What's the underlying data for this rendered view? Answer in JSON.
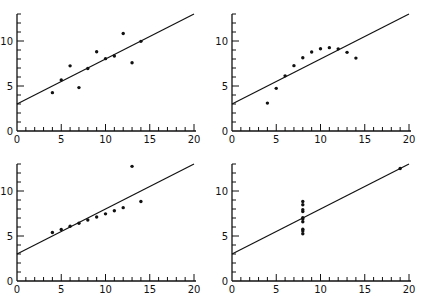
{
  "figure": {
    "title": ""
  },
  "axes_common": {
    "x_ticks": [
      "0",
      "5",
      "10",
      "15",
      "20"
    ],
    "y_ticks": [
      "0",
      "5",
      "10"
    ],
    "xlim": [
      0,
      20
    ],
    "ylim": [
      0,
      13
    ],
    "fit_line": {
      "intercept": 3.0,
      "slope": 0.5
    }
  },
  "chart_data": [
    {
      "type": "scatter",
      "title": "",
      "xlabel": "",
      "ylabel": "",
      "xlim": [
        0,
        20
      ],
      "ylim": [
        0,
        13
      ],
      "x_ticks": [
        0,
        5,
        10,
        15,
        20
      ],
      "y_ticks": [
        0,
        5,
        10
      ],
      "grid": false,
      "series": [
        {
          "name": "I",
          "x": [
            10,
            8,
            13,
            9,
            11,
            14,
            6,
            4,
            12,
            7,
            5
          ],
          "y": [
            8.04,
            6.95,
            7.58,
            8.81,
            8.33,
            9.96,
            7.24,
            4.26,
            10.84,
            4.82,
            5.68
          ]
        }
      ],
      "fit_line": {
        "intercept": 3.0,
        "slope": 0.5
      }
    },
    {
      "type": "scatter",
      "title": "",
      "xlabel": "",
      "ylabel": "",
      "xlim": [
        0,
        20
      ],
      "ylim": [
        0,
        13
      ],
      "x_ticks": [
        0,
        5,
        10,
        15,
        20
      ],
      "y_ticks": [
        0,
        5,
        10
      ],
      "grid": false,
      "series": [
        {
          "name": "II",
          "x": [
            10,
            8,
            13,
            9,
            11,
            14,
            6,
            4,
            12,
            7,
            5
          ],
          "y": [
            9.14,
            8.14,
            8.74,
            8.77,
            9.26,
            8.1,
            6.13,
            3.1,
            9.13,
            7.26,
            4.74
          ]
        }
      ],
      "fit_line": {
        "intercept": 3.0,
        "slope": 0.5
      }
    },
    {
      "type": "scatter",
      "title": "",
      "xlabel": "",
      "ylabel": "",
      "xlim": [
        0,
        20
      ],
      "ylim": [
        0,
        13
      ],
      "x_ticks": [
        0,
        5,
        10,
        15,
        20
      ],
      "y_ticks": [
        0,
        5,
        10
      ],
      "grid": false,
      "series": [
        {
          "name": "III",
          "x": [
            10,
            8,
            13,
            9,
            11,
            14,
            6,
            4,
            12,
            7,
            5
          ],
          "y": [
            7.46,
            6.77,
            12.74,
            7.11,
            7.81,
            8.84,
            6.08,
            5.39,
            8.15,
            6.42,
            5.73
          ]
        }
      ],
      "fit_line": {
        "intercept": 3.0,
        "slope": 0.5
      }
    },
    {
      "type": "scatter",
      "title": "",
      "xlabel": "",
      "ylabel": "",
      "xlim": [
        0,
        20
      ],
      "ylim": [
        0,
        13
      ],
      "x_ticks": [
        0,
        5,
        10,
        15,
        20
      ],
      "y_ticks": [
        0,
        5,
        10
      ],
      "grid": false,
      "series": [
        {
          "name": "IV",
          "x": [
            8,
            8,
            8,
            8,
            8,
            8,
            8,
            19,
            8,
            8,
            8
          ],
          "y": [
            6.58,
            5.76,
            7.71,
            8.84,
            8.47,
            7.04,
            5.25,
            12.5,
            5.56,
            7.91,
            6.89
          ]
        }
      ],
      "fit_line": {
        "intercept": 3.0,
        "slope": 0.5
      }
    }
  ]
}
